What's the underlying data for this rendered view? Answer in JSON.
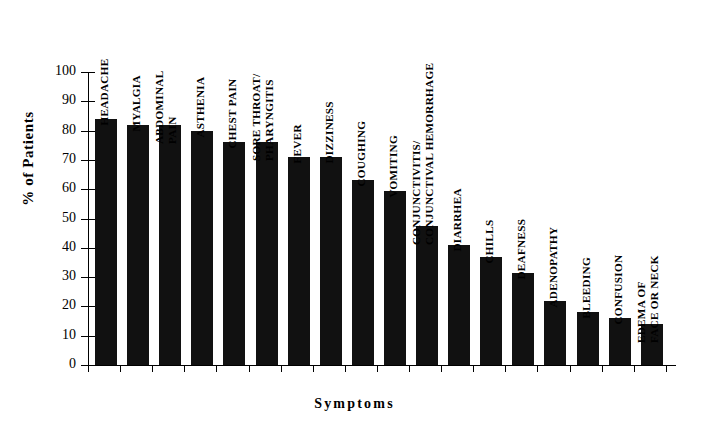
{
  "chart_data": {
    "type": "bar",
    "title": "",
    "xlabel": "Symptoms",
    "ylabel": "% of Patients",
    "ylim": [
      0,
      100
    ],
    "ytick_step": 10,
    "yticks": [
      0,
      10,
      20,
      30,
      40,
      50,
      60,
      70,
      80,
      90,
      100
    ],
    "grid": false,
    "legend": null,
    "bar_color": "#111111",
    "categories": [
      "HEADACHE",
      "MYALGIA",
      "ABDOMINAL PAIN",
      "ASTHENIA",
      "CHEST PAIN",
      "SORE THROAT/ PHARYNGITIS",
      "FEVER",
      "DIZZINESS",
      "COUGHING",
      "VOMITING",
      "CONJUNCTIVITIS/ CONJUNCTIVAL HEMORRHAGE",
      "DIARRHEA",
      "CHILLS",
      "DEAFNESS",
      "ADENOPATHY",
      "BLEEDING",
      "CONFUSION",
      "EDEMA OF FACE OR NECK"
    ],
    "category_lines": [
      [
        "HEADACHE"
      ],
      [
        "MYALGIA"
      ],
      [
        "ABDOMINAL",
        "PAIN"
      ],
      [
        "ASTHENIA"
      ],
      [
        "CHEST PAIN"
      ],
      [
        "SORE THROAT/",
        "PHARYNGITIS"
      ],
      [
        "FEVER"
      ],
      [
        "DIZZINESS"
      ],
      [
        "COUGHING"
      ],
      [
        "VOMITING"
      ],
      [
        "CONJUNCTIVITIS/",
        "CONJUNCTIVAL HEMORRHAGE"
      ],
      [
        "DIARRHEA"
      ],
      [
        "CHILLS"
      ],
      [
        "DEAFNESS"
      ],
      [
        "ADENOPATHY"
      ],
      [
        "BLEEDING"
      ],
      [
        "CONFUSION"
      ],
      [
        "EDEMA OF",
        "FACE OR NECK"
      ]
    ],
    "values": [
      84,
      82,
      82,
      80,
      76,
      76,
      71,
      71,
      63,
      59.5,
      47.5,
      41,
      37,
      31.5,
      22,
      18,
      16,
      14
    ]
  }
}
